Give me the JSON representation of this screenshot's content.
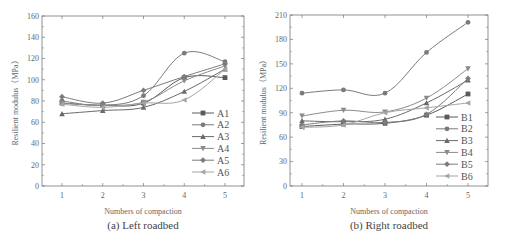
{
  "chart_data": [
    {
      "type": "line",
      "title": "(a) Left roadbed",
      "xlabel": "Numbers of compaction",
      "ylabel": "Resilient modulus（MPa）",
      "x": [
        1,
        2,
        3,
        4,
        5
      ],
      "xticks": [
        "1",
        "2",
        "3",
        "4",
        "5"
      ],
      "ylim": [
        0,
        160
      ],
      "yticks": [
        "0",
        "20",
        "40",
        "60",
        "80",
        "100",
        "120",
        "140",
        "160"
      ],
      "grid": false,
      "legend_position": "lower right",
      "series": [
        {
          "name": "A1",
          "marker": "square",
          "values": [
            78,
            76,
            78,
            102,
            102
          ]
        },
        {
          "name": "A2",
          "marker": "circle",
          "values": [
            80,
            76,
            85,
            125,
            117
          ]
        },
        {
          "name": "A3",
          "marker": "triangle-up",
          "values": [
            68,
            71,
            74,
            89,
            110
          ]
        },
        {
          "name": "A4",
          "marker": "triangle-down",
          "values": [
            78,
            76,
            79,
            99,
            113
          ]
        },
        {
          "name": "A5",
          "marker": "diamond",
          "values": [
            84,
            78,
            90,
            103,
            115
          ]
        },
        {
          "name": "A6",
          "marker": "triangle-left",
          "values": [
            77,
            74,
            78,
            81,
            110
          ]
        }
      ]
    },
    {
      "type": "line",
      "title": "(b) Right roadbed",
      "xlabel": "Numbers of compaction",
      "ylabel": "Resilient modulus（MPa）",
      "x": [
        1,
        2,
        3,
        4,
        5
      ],
      "xticks": [
        "1",
        "2",
        "3",
        "4",
        "5"
      ],
      "ylim": [
        0,
        210
      ],
      "yticks": [
        "0",
        "30",
        "60",
        "90",
        "120",
        "150",
        "180",
        "210"
      ],
      "grid": false,
      "legend_position": "lower right",
      "series": [
        {
          "name": "B1",
          "marker": "square",
          "values": [
            73,
            76,
            77,
            87,
            113
          ]
        },
        {
          "name": "B2",
          "marker": "circle",
          "values": [
            114,
            118,
            114,
            164,
            201
          ]
        },
        {
          "name": "B3",
          "marker": "triangle-up",
          "values": [
            80,
            79,
            82,
            102,
            130
          ]
        },
        {
          "name": "B4",
          "marker": "triangle-down",
          "values": [
            86,
            93,
            91,
            108,
            144
          ]
        },
        {
          "name": "B5",
          "marker": "diamond",
          "values": [
            75,
            80,
            78,
            88,
            132
          ]
        },
        {
          "name": "B6",
          "marker": "triangle-left",
          "values": [
            72,
            75,
            90,
            96,
            102
          ]
        }
      ]
    }
  ],
  "colors": {
    "series": [
      "#5a5a5a",
      "#7a7a7a",
      "#6a6a6a",
      "#8a8a8a",
      "#7c7c7c",
      "#a5a5a5"
    ],
    "axis": "#777777"
  }
}
